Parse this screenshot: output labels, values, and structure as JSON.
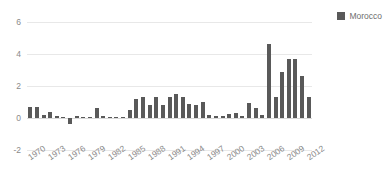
{
  "chart_data": {
    "type": "bar",
    "title": "",
    "subtitle": "",
    "xlabel": "",
    "ylabel": "",
    "ylim": [
      -2,
      6
    ],
    "y_ticks": [
      6,
      4,
      2,
      0,
      -2
    ],
    "grid": true,
    "legend_position": "top-right",
    "x_tick_labels": [
      "1970",
      "1973",
      "1976",
      "1979",
      "1982",
      "1985",
      "1988",
      "1991",
      "1994",
      "1997",
      "2000",
      "2003",
      "2006",
      "2009",
      "2012"
    ],
    "x_tick_step": 3,
    "series": [
      {
        "name": "Morocco",
        "color": "#595959",
        "x": [
          1970,
          1971,
          1972,
          1973,
          1974,
          1975,
          1976,
          1977,
          1978,
          1979,
          1980,
          1981,
          1982,
          1983,
          1984,
          1985,
          1986,
          1987,
          1988,
          1989,
          1990,
          1991,
          1992,
          1993,
          1994,
          1995,
          1996,
          1997,
          1998,
          1999,
          2000,
          2001,
          2002,
          2003,
          2004,
          2005,
          2006,
          2007,
          2008,
          2009,
          2010,
          2011,
          2012
        ],
        "values": [
          0.7,
          0.7,
          0.2,
          0.35,
          0.1,
          0.05,
          -0.35,
          0.1,
          0.05,
          0.05,
          0.6,
          0.1,
          0.05,
          0.05,
          0.05,
          0.5,
          1.2,
          1.3,
          0.8,
          1.3,
          0.8,
          1.3,
          1.5,
          1.3,
          0.9,
          0.8,
          1.0,
          0.2,
          0.1,
          0.1,
          0.25,
          0.3,
          0.1,
          0.95,
          0.6,
          0.2,
          4.6,
          1.3,
          2.9,
          3.7,
          3.7,
          2.6,
          1.3
        ]
      }
    ]
  },
  "legend": {
    "entries": [
      {
        "label": "Morocco",
        "color": "#595959",
        "swatch": "square-swatch"
      }
    ]
  }
}
